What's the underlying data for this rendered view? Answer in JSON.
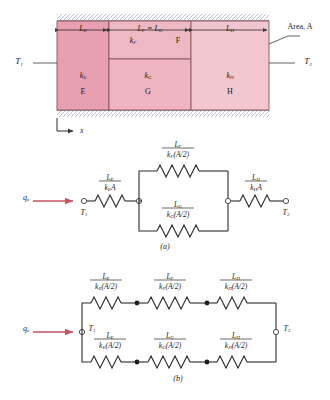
{
  "figure": {
    "caption_a": "(a)",
    "caption_b": "(b)"
  },
  "slab": {
    "area_label": "Area, A",
    "temp_left": "T",
    "temp_left_sub": "1",
    "temp_right": "T",
    "temp_right_sub": "2",
    "axis_label": "x",
    "dimensions": [
      {
        "name": "L",
        "sub": "E"
      },
      {
        "name": "L",
        "sub": "F"
      },
      {
        "name": "L",
        "sub": "H"
      }
    ],
    "dim_mid_text": "L",
    "dim_mid_sub1": "F",
    "dim_mid_eq": " = L",
    "dim_mid_sub2": "G",
    "regions": [
      {
        "id": "E",
        "k": "k",
        "k_sub": "E",
        "letter": "E",
        "color": "#e8a0b0"
      },
      {
        "id": "F",
        "k": "k",
        "k_sub": "F",
        "letter": "F",
        "color": "#efb9c4"
      },
      {
        "id": "G",
        "k": "k",
        "k_sub": "G",
        "letter": "G",
        "color": "#efb9c4"
      },
      {
        "id": "H",
        "k": "k",
        "k_sub": "H",
        "letter": "H",
        "color": "#f2c6ce"
      }
    ]
  },
  "circuit_a": {
    "flux_label": "q",
    "flux_sub": "x",
    "node_left": "T",
    "node_left_sub": "1",
    "node_right": "T",
    "node_right_sub": "2",
    "resistors": [
      {
        "id": "E",
        "num": "L",
        "num_sub": "E",
        "den": "k",
        "den_sub": "E",
        "den_rest": "A"
      },
      {
        "id": "F",
        "num": "L",
        "num_sub": "F",
        "den": "k",
        "den_sub": "F",
        "den_rest": "(A/2)"
      },
      {
        "id": "G",
        "num": "L",
        "num_sub": "G",
        "den": "k",
        "den_sub": "G",
        "den_rest": "(A/2)"
      },
      {
        "id": "H",
        "num": "L",
        "num_sub": "H",
        "den": "k",
        "den_sub": "H",
        "den_rest": "A"
      }
    ]
  },
  "circuit_b": {
    "flux_label": "q",
    "flux_sub": "x",
    "node_left": "T",
    "node_left_sub": "1",
    "node_right": "T",
    "node_right_sub": "2",
    "top_resistors": [
      {
        "id": "E",
        "num": "L",
        "num_sub": "E",
        "den": "k",
        "den_sub": "E",
        "den_rest": "(A/2)"
      },
      {
        "id": "F",
        "num": "L",
        "num_sub": "F",
        "den": "k",
        "den_sub": "F",
        "den_rest": "(A/2)"
      },
      {
        "id": "H",
        "num": "L",
        "num_sub": "H",
        "den": "k",
        "den_sub": "H",
        "den_rest": "(A/2)"
      }
    ],
    "bottom_resistors": [
      {
        "id": "E",
        "num": "L",
        "num_sub": "E",
        "den": "k",
        "den_sub": "E",
        "den_rest": "(A/2)"
      },
      {
        "id": "G",
        "num": "L",
        "num_sub": "G",
        "den": "k",
        "den_sub": "G",
        "den_rest": "(A/2)"
      },
      {
        "id": "H",
        "num": "L",
        "num_sub": "H",
        "den": "k",
        "den_sub": "H",
        "den_rest": "(A/2)"
      }
    ]
  },
  "colors": {
    "arrow_red": "#c4555f",
    "line": "#3a3a3a",
    "slab_border": "#8a5560"
  }
}
